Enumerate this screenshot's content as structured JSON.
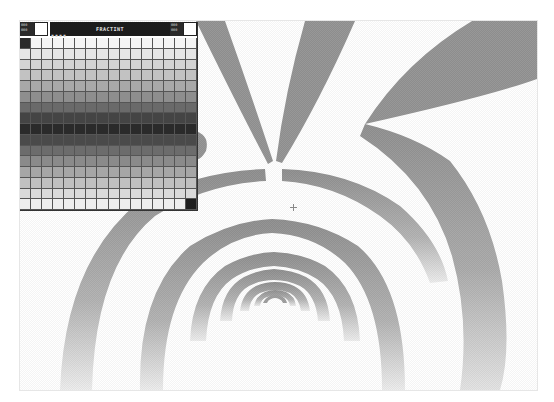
{
  "app": {
    "name": "FRACTINT",
    "view": "palette editor over fractal image"
  },
  "palette_editor": {
    "title": "FRACTINT",
    "left_corner_label": "000\n000",
    "right_corner_label": "000\n000",
    "indicator_dots": "▪▪▪▪",
    "left_swatch_color": "#ffffff",
    "right_swatch_color": "#ffffff",
    "grid_rows": 16,
    "grid_cols": 16,
    "row_colors": [
      "#f4f4f4",
      "#e6e6e6",
      "#d4d4d4",
      "#c2c2c2",
      "#a8a8a8",
      "#8e8e8e",
      "#6a6a6a",
      "#444444",
      "#2a2a2a",
      "#4a4a4a",
      "#6c6c6c",
      "#8a8a8a",
      "#a6a6a6",
      "#c0c0c0",
      "#dadada",
      "#eeeeee"
    ],
    "first_cell_color": "#2a2a2a",
    "last_cell_color": "#1e1e1e"
  },
  "fractal": {
    "arm_color": "#8f8f8f",
    "ring_colors": [
      "#d8d8d8",
      "#bcbcbc",
      "#a8a8a8",
      "#9a9a9a",
      "#909090",
      "#888888",
      "#7c7c7c"
    ],
    "background": "#ffffff"
  },
  "cursor": {
    "type": "crosshair"
  }
}
